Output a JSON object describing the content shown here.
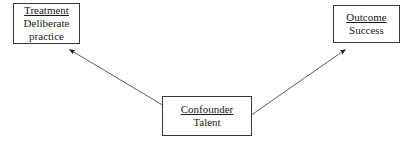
{
  "diagram": {
    "background_color": "#ffffff",
    "line_color": "#3a3a3a",
    "text_color": "#1a1a1a",
    "nodes": [
      {
        "id": "treatment",
        "role_label": "Treatment",
        "value_label_line1": "Deliberate",
        "value_label_line2": "practice"
      },
      {
        "id": "outcome",
        "role_label": "Outcome",
        "value_label": "Success"
      },
      {
        "id": "confounder",
        "role_label": "Confounder",
        "value_label": "Talent"
      }
    ],
    "arrows": [
      {
        "id": "confounder-to-treatment",
        "from": "confounder",
        "to": "treatment",
        "direction": "up-left"
      },
      {
        "id": "confounder-to-outcome",
        "from": "confounder",
        "to": "outcome",
        "direction": "up-right"
      }
    ]
  }
}
